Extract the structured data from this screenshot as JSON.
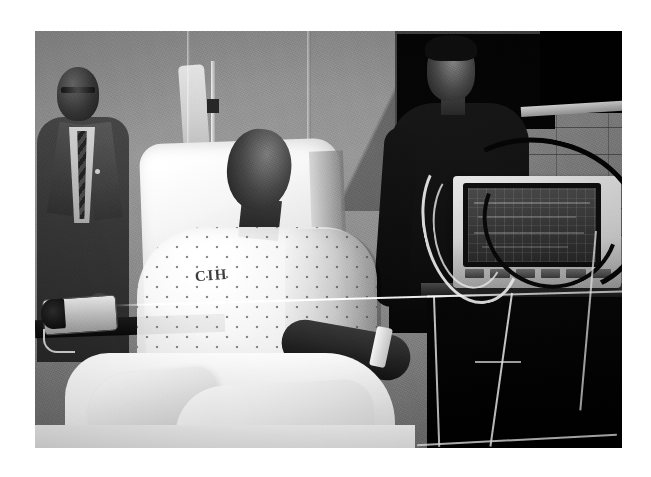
{
  "image": {
    "kind": "photograph",
    "medium": "black-and-white news photograph",
    "caption_visible": "",
    "background_color": "#ffffff",
    "frame": {
      "left": 35,
      "top": 31,
      "width": 587,
      "height": 417
    }
  },
  "scene": {
    "setting": "hospital patient room",
    "description": "A young man sits upright in a hospital bed wearing a patterned hospital gown; two men stand behind him and medical equipment surrounds the bed."
  },
  "subjects": {
    "patient": {
      "label": "patient-in-bed",
      "gown_text": "CIH",
      "gown_pattern": "polka dot",
      "posture": "seated upright, looking upward",
      "arm_detail": "white tape band on forearm"
    },
    "man_in_suit": {
      "label": "man-in-suit-left",
      "attire": "dark suit, light shirt, patterned tie",
      "accessory": "eyeglasses, lapel pin"
    },
    "standing_man": {
      "label": "man-standing-right",
      "attire": "dark t-shirt",
      "posture": "standing behind equipment cart"
    }
  },
  "equipment": {
    "iv_pole": {
      "label": "iv-pole-with-bag",
      "items": "hanging IV bag, stacked infusion pumps"
    },
    "monitor": {
      "label": "patient-vital-signs-monitor",
      "screen_content": "faint waveform traces on dark grid",
      "button_count": 6,
      "buttons": [
        "",
        "",
        "",
        "",
        "",
        ""
      ]
    },
    "cart": {
      "label": "equipment-cart",
      "color": "#0a0a0a"
    },
    "bp_cuff": {
      "label": "blood-pressure-cuff",
      "location": "bed rail, lower left"
    },
    "cables": {
      "label": "monitor-cables",
      "description": "looping dark and white cables draped over monitor and cart"
    }
  },
  "room": {
    "wall": "grey painted wall with curtain track",
    "block_wall": "cinder block wall at right",
    "doorway": "dark doorway opening upper right",
    "bed": "hospital bed with white sheets and blanket"
  },
  "palette": {
    "paper_white": "#ffffff",
    "highlight": "#f2f2f2",
    "midtone": "#8d8d8d",
    "shadow": "#2a2a2a",
    "black": "#0a0a0a"
  }
}
